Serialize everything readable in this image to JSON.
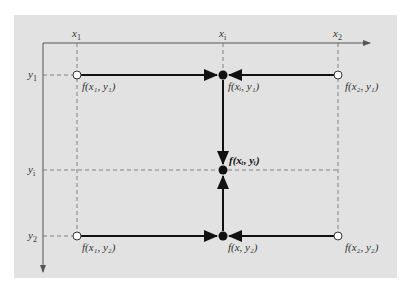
{
  "figure": {
    "background_color": "#e2e2e2",
    "axis_color": "#555555",
    "line_color": "#111111",
    "axes": {
      "x_ticks": [
        {
          "id": "x1",
          "label": "x",
          "sub": "1"
        },
        {
          "id": "xi",
          "label": "x",
          "sub": "i"
        },
        {
          "id": "x2",
          "label": "x",
          "sub": "2"
        }
      ],
      "y_ticks": [
        {
          "id": "y1",
          "label": "y",
          "sub": "1"
        },
        {
          "id": "yi",
          "label": "y",
          "sub": "i"
        },
        {
          "id": "y2",
          "label": "y",
          "sub": "2"
        }
      ]
    },
    "points": {
      "f_x1_y1": {
        "text": "f(x₁, y₁)",
        "marker": "open"
      },
      "f_xi_y1": {
        "text": "f(xᵢ, y₁)",
        "marker": "filled"
      },
      "f_x2_y1": {
        "text": "f(x₂, y₁)",
        "marker": "open"
      },
      "f_xi_yi": {
        "text": "f(xᵢ, yᵢ)",
        "marker": "filled",
        "bold": true
      },
      "f_x1_y2": {
        "text": "f(x₁, y₂)",
        "marker": "open"
      },
      "f_x_y2": {
        "text": "f(x, y₂)",
        "marker": "filled"
      },
      "f_x2_y2": {
        "text": "f(x₂, y₂)",
        "marker": "open"
      }
    }
  }
}
